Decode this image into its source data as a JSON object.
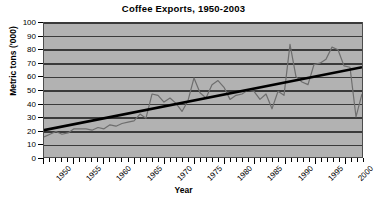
{
  "chart_data": {
    "type": "line",
    "title": "Coffee Exports, 1950-2003",
    "xlabel": "Year",
    "ylabel": "Metric tons ('000)",
    "xlim": [
      1950,
      2003
    ],
    "ylim": [
      0,
      100
    ],
    "grid": true,
    "legend": "none",
    "y_ticks": [
      0,
      10,
      20,
      30,
      40,
      50,
      60,
      70,
      80,
      90,
      100
    ],
    "x_ticks": [
      1950,
      1955,
      1960,
      1965,
      1970,
      1975,
      1980,
      1985,
      1990,
      1995,
      2000
    ],
    "x_tick_labels": [
      "1950",
      "1955",
      "1960",
      "1965",
      "1970",
      "1975",
      "1980",
      "1985",
      "1990",
      "1995",
      "2000"
    ],
    "x_minor_tick_step": 1,
    "series": [
      {
        "name": "Coffee exports",
        "kind": "line",
        "color": "#6e6e6e",
        "x": [
          1950,
          1951,
          1952,
          1953,
          1954,
          1955,
          1956,
          1957,
          1958,
          1959,
          1960,
          1961,
          1962,
          1963,
          1964,
          1965,
          1966,
          1967,
          1968,
          1969,
          1970,
          1971,
          1972,
          1973,
          1974,
          1975,
          1976,
          1977,
          1978,
          1979,
          1980,
          1981,
          1982,
          1983,
          1984,
          1985,
          1986,
          1987,
          1988,
          1989,
          1990,
          1991,
          1992,
          1993,
          1994,
          1995,
          1996,
          1997,
          1998,
          1999,
          2000,
          2001,
          2002,
          2003
        ],
        "values": [
          15,
          17,
          19,
          17,
          18,
          21,
          21,
          21,
          20,
          22,
          21,
          24,
          23,
          25,
          26,
          27,
          32,
          29,
          47,
          46,
          41,
          44,
          40,
          34,
          42,
          59,
          48,
          44,
          54,
          57,
          52,
          43,
          46,
          47,
          50,
          49,
          43,
          47,
          36,
          49,
          46,
          84,
          60,
          56,
          54,
          69,
          70,
          73,
          82,
          80,
          68,
          67,
          30,
          47
        ]
      },
      {
        "name": "Linear trendline",
        "kind": "trendline",
        "color": "#000000",
        "x": [
          1950,
          2003
        ],
        "values": [
          20,
          67
        ]
      }
    ]
  }
}
